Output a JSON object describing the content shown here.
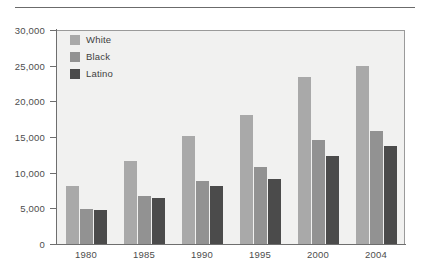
{
  "chart_data": {
    "type": "bar",
    "title": "",
    "xlabel": "",
    "ylabel": "",
    "categories": [
      "1980",
      "1985",
      "1990",
      "1995",
      "2000",
      "2004"
    ],
    "series": [
      {
        "name": "White",
        "color": "#a9a9a9",
        "values": [
          8100,
          11700,
          15100,
          18100,
          23400,
          25000
        ]
      },
      {
        "name": "Black",
        "color": "#929292",
        "values": [
          4900,
          6800,
          8900,
          10800,
          14600,
          15800
        ]
      },
      {
        "name": "Latino",
        "color": "#4b4b4b",
        "values": [
          4800,
          6400,
          8100,
          9100,
          12400,
          13800
        ]
      }
    ],
    "ylim": [
      0,
      30000
    ],
    "yticks": [
      0,
      5000,
      10000,
      15000,
      20000,
      25000,
      30000
    ],
    "ytick_labels": [
      "0",
      "5,000",
      "10,000",
      "15,000",
      "20,000",
      "25,000",
      "30,000"
    ],
    "grid": false,
    "legend_position": "top-left",
    "plot_background": "#f1f1f0",
    "axis_color": "#6e6e6e"
  }
}
